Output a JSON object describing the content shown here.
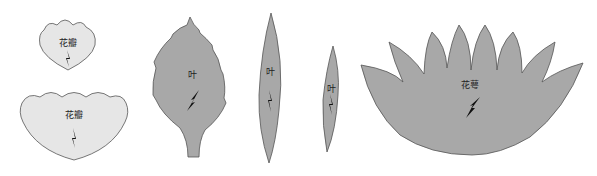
{
  "colors": {
    "petal_fill": "#e6e6e6",
    "leaf_fill": "#a8a8a8",
    "sepal_fill": "#a8a8a8",
    "outline": "#555555",
    "grain_arrow": "#111111"
  },
  "shapes": [
    {
      "id": "petal-small",
      "label": "花瓣"
    },
    {
      "id": "petal-large",
      "label": "花瓣"
    },
    {
      "id": "leaf-serrated",
      "label": "叶"
    },
    {
      "id": "leaf-long",
      "label": "叶"
    },
    {
      "id": "leaf-narrow",
      "label": "叶"
    },
    {
      "id": "sepal",
      "label": "花萼"
    }
  ]
}
